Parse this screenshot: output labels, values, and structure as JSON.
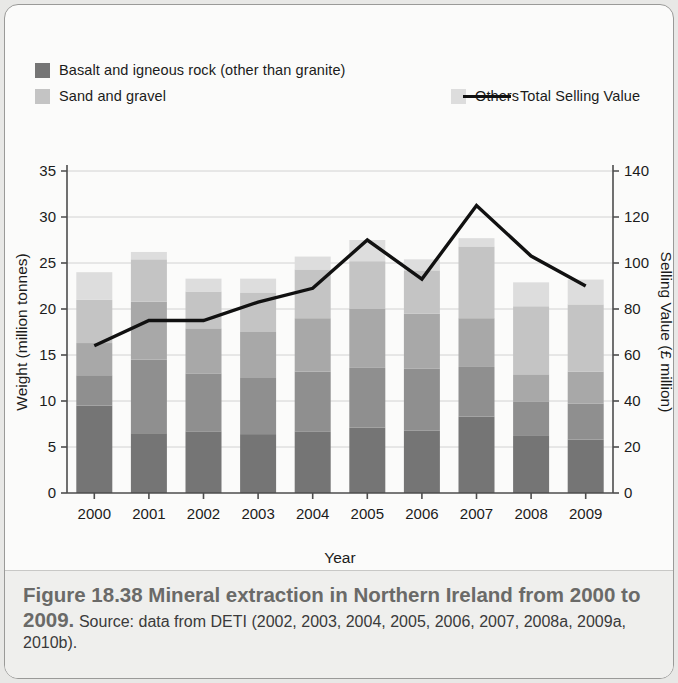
{
  "figure": {
    "caption_title": "Figure 18.38 Mineral extraction in Northern Ireland from 2000 to 2009.",
    "caption_source": "Source: data from DETI (2002, 2003, 2004, 2005, 2006, 2007, 2008a, 2009a, 2010b)."
  },
  "colors": {
    "basalt": "#757575",
    "sandstone": "#8f8f8f",
    "limestone": "#a8a8a8",
    "sand_gravel": "#c4c4c4",
    "others": "#dddddd",
    "line": "#111111",
    "grid": "#d2d2d2",
    "axis": "#4d4d4d",
    "card_bg": "#fbfbfa",
    "caption_bg": "#efefed"
  },
  "legend": {
    "rows": [
      [
        {
          "label": "Basalt and igneous rock (other than granite)",
          "swatch": "basalt",
          "type": "swatch"
        },
        {
          "label": "Sandstone",
          "swatch": "sandstone",
          "type": "swatch"
        },
        {
          "label": "Limestone",
          "swatch": "limestone",
          "type": "swatch"
        }
      ],
      [
        {
          "label": "Sand and gravel",
          "swatch": "sand_gravel",
          "type": "swatch"
        },
        {
          "label": "Others",
          "swatch": "others",
          "type": "swatch"
        },
        {
          "label": "Total Selling Value",
          "swatch": "line",
          "type": "line"
        }
      ]
    ]
  },
  "chart_data": {
    "type": "bar",
    "subtype": "stacked-bar-with-line",
    "title": "Mineral extraction in Northern Ireland from 2000 to 2009",
    "xlabel": "Year",
    "ylabel": "Weight (million tonnes)",
    "y2label": "Selling Value (£ million)",
    "categories": [
      "2000",
      "2001",
      "2002",
      "2003",
      "2004",
      "2005",
      "2006",
      "2007",
      "2008",
      "2009"
    ],
    "ylim": [
      0,
      35
    ],
    "yticks": [
      0,
      5,
      10,
      15,
      20,
      25,
      30,
      35
    ],
    "y2lim": [
      0,
      140
    ],
    "y2ticks": [
      0,
      20,
      40,
      60,
      80,
      100,
      120,
      140
    ],
    "grid": true,
    "legend_position": "top",
    "series": [
      {
        "name": "Basalt and igneous rock (other than granite)",
        "axis": "left",
        "color_key": "basalt",
        "values": [
          9.5,
          6.5,
          6.7,
          6.4,
          6.7,
          7.1,
          6.8,
          8.3,
          6.2,
          5.8
        ]
      },
      {
        "name": "Sandstone",
        "axis": "left",
        "color_key": "sandstone",
        "values": [
          3.3,
          8.0,
          6.3,
          6.1,
          6.5,
          6.5,
          6.7,
          5.4,
          3.7,
          3.9
        ]
      },
      {
        "name": "Limestone",
        "axis": "left",
        "color_key": "limestone",
        "values": [
          3.5,
          6.3,
          4.9,
          5.0,
          5.8,
          6.4,
          6.0,
          5.3,
          3.0,
          3.5
        ]
      },
      {
        "name": "Sand and gravel",
        "axis": "left",
        "color_key": "sand_gravel",
        "values": [
          4.7,
          4.6,
          4.0,
          4.3,
          5.3,
          5.2,
          4.7,
          7.8,
          7.4,
          7.3
        ]
      },
      {
        "name": "Others",
        "axis": "left",
        "color_key": "others",
        "values": [
          3.0,
          0.8,
          1.4,
          1.5,
          1.4,
          2.3,
          1.2,
          0.9,
          2.6,
          2.7
        ]
      },
      {
        "name": "Total Selling Value",
        "axis": "right",
        "type": "line",
        "color_key": "line",
        "values": [
          64,
          75,
          75,
          83,
          89,
          110,
          93,
          125,
          103,
          90
        ]
      }
    ],
    "totals": [
      24.0,
      26.2,
      23.3,
      23.3,
      25.7,
      27.5,
      25.4,
      27.7,
      22.9,
      23.2
    ]
  }
}
